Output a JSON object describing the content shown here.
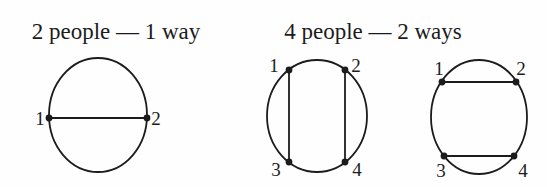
{
  "figure": {
    "width": 547,
    "height": 187,
    "background_color": "#fefefe",
    "ink_color": "#1c1c1c",
    "title_font_size": 23,
    "label_font_size": 19,
    "circle_stroke_width": 1.8,
    "chord_stroke_width": 1.8,
    "dot_radius": 3.4,
    "panels": [
      {
        "title": "2 people — 1 way",
        "title_x": 116,
        "title_y": 39,
        "diagrams": [
          {
            "ellipse": {
              "cx": 98,
              "cy": 115,
              "rx": 49,
              "ry": 57
            },
            "points": [
              {
                "label": "1",
                "x": 49,
                "y": 118,
                "lx": 40,
                "ly": 125
              },
              {
                "label": "2",
                "x": 147,
                "y": 118,
                "lx": 156,
                "ly": 125
              }
            ],
            "chords": [
              [
                0,
                1
              ]
            ]
          }
        ]
      },
      {
        "title": "4 people — 2 ways",
        "title_x": 373,
        "title_y": 39,
        "diagrams": [
          {
            "ellipse": {
              "cx": 317,
              "cy": 116,
              "rx": 50,
              "ry": 56
            },
            "points": [
              {
                "label": "1",
                "x": 289,
                "y": 70,
                "lx": 274,
                "ly": 72
              },
              {
                "label": "2",
                "x": 345,
                "y": 70,
                "lx": 356,
                "ly": 72
              },
              {
                "label": "3",
                "x": 289,
                "y": 162,
                "lx": 276,
                "ly": 176
              },
              {
                "label": "4",
                "x": 345,
                "y": 162,
                "lx": 357,
                "ly": 176
              }
            ],
            "chords": [
              [
                0,
                2
              ],
              [
                1,
                3
              ]
            ]
          },
          {
            "ellipse": {
              "cx": 479,
              "cy": 117,
              "rx": 48,
              "ry": 57
            },
            "points": [
              {
                "label": "1",
                "x": 442,
                "y": 82,
                "lx": 439,
                "ly": 75
              },
              {
                "label": "2",
                "x": 516,
                "y": 82,
                "lx": 521,
                "ly": 75
              },
              {
                "label": "3",
                "x": 444,
                "y": 156,
                "lx": 441,
                "ly": 177
              },
              {
                "label": "4",
                "x": 514,
                "y": 156,
                "lx": 523,
                "ly": 177
              }
            ],
            "chords": [
              [
                0,
                1
              ],
              [
                2,
                3
              ]
            ]
          }
        ]
      }
    ]
  }
}
